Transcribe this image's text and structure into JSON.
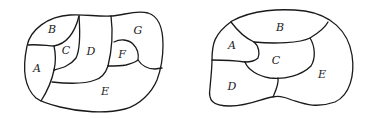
{
  "maps": [
    {
      "id": "left",
      "regions": [
        {
          "label": "A",
          "x": 37,
          "y": 68
        },
        {
          "label": "B",
          "x": 52,
          "y": 29
        },
        {
          "label": "C",
          "x": 66,
          "y": 49
        },
        {
          "label": "D",
          "x": 91,
          "y": 51
        },
        {
          "label": "E",
          "x": 105,
          "y": 91
        },
        {
          "label": "F",
          "x": 122,
          "y": 54
        },
        {
          "label": "G",
          "x": 138,
          "y": 30
        }
      ]
    },
    {
      "id": "right",
      "regions": [
        {
          "label": "A",
          "x": 232,
          "y": 45
        },
        {
          "label": "B",
          "x": 280,
          "y": 27
        },
        {
          "label": "C",
          "x": 276,
          "y": 60
        },
        {
          "label": "D",
          "x": 232,
          "y": 86
        },
        {
          "label": "E",
          "x": 322,
          "y": 74
        }
      ]
    }
  ]
}
